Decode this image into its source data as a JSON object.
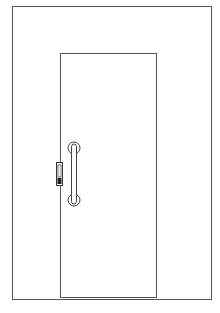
{
  "colors": {
    "line": "#4a4a4a",
    "background": "#ffffff"
  },
  "elements": {
    "outer_frame": "wall-opening-frame",
    "door_leaf": "door-leaf",
    "handle": "pull-handle",
    "lock": "lock-plate"
  }
}
